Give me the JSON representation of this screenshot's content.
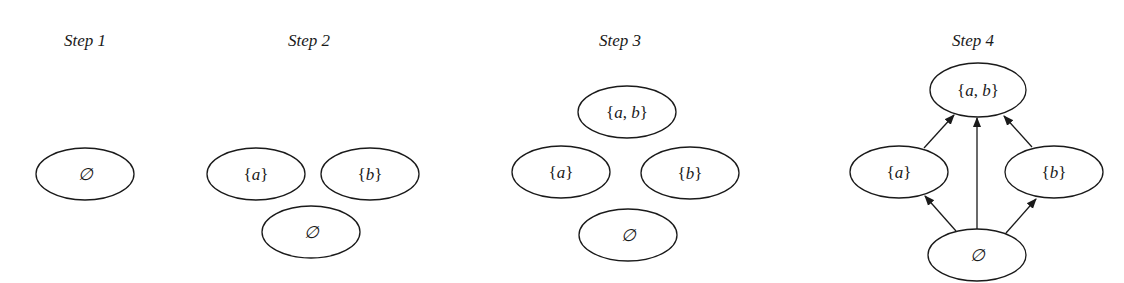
{
  "steps": [
    {
      "title": "Step 1",
      "title_pos": [
        85,
        46
      ],
      "nodes": [
        {
          "id": "empty",
          "label": "∅",
          "cx": 85,
          "cy": 174,
          "rx": 49,
          "ry": 26
        }
      ],
      "edges": []
    },
    {
      "title": "Step 2",
      "title_pos": [
        309,
        46
      ],
      "nodes": [
        {
          "id": "a",
          "label": "{a}",
          "cx": 256,
          "cy": 174,
          "rx": 49,
          "ry": 26
        },
        {
          "id": "b",
          "label": "{b}",
          "cx": 370,
          "cy": 174,
          "rx": 49,
          "ry": 26
        },
        {
          "id": "empty",
          "label": "∅",
          "cx": 311,
          "cy": 232,
          "rx": 49,
          "ry": 26
        }
      ],
      "edges": []
    },
    {
      "title": "Step 3",
      "title_pos": [
        620,
        46
      ],
      "nodes": [
        {
          "id": "ab",
          "label": "{a, b}",
          "cx": 627,
          "cy": 112,
          "rx": 49,
          "ry": 26
        },
        {
          "id": "a",
          "label": "{a}",
          "cx": 561,
          "cy": 172,
          "rx": 49,
          "ry": 26
        },
        {
          "id": "b",
          "label": "{b}",
          "cx": 690,
          "cy": 173,
          "rx": 49,
          "ry": 26
        },
        {
          "id": "empty",
          "label": "∅",
          "cx": 628,
          "cy": 235,
          "rx": 49,
          "ry": 26
        }
      ],
      "edges": []
    },
    {
      "title": "Step 4",
      "title_pos": [
        973,
        46
      ],
      "nodes": [
        {
          "id": "ab",
          "label": "{a, b}",
          "cx": 978,
          "cy": 90,
          "rx": 48,
          "ry": 27
        },
        {
          "id": "a",
          "label": "{a}",
          "cx": 899,
          "cy": 172,
          "rx": 49,
          "ry": 26
        },
        {
          "id": "b",
          "label": "{b}",
          "cx": 1054,
          "cy": 172,
          "rx": 49,
          "ry": 26
        },
        {
          "id": "empty",
          "label": "∅",
          "cx": 977,
          "cy": 255,
          "rx": 49,
          "ry": 26
        }
      ],
      "edges": [
        {
          "from": "empty",
          "to": "a",
          "x1": 956,
          "y1": 231,
          "x2": 925,
          "y2": 196
        },
        {
          "from": "empty",
          "to": "ab",
          "x1": 977,
          "y1": 229,
          "x2": 977,
          "y2": 118
        },
        {
          "from": "empty",
          "to": "b",
          "x1": 1006,
          "y1": 233,
          "x2": 1036,
          "y2": 199
        },
        {
          "from": "a",
          "to": "ab",
          "x1": 924,
          "y1": 148,
          "x2": 954,
          "y2": 115
        },
        {
          "from": "b",
          "to": "ab",
          "x1": 1032,
          "y1": 147,
          "x2": 1004,
          "y2": 116
        }
      ]
    }
  ]
}
